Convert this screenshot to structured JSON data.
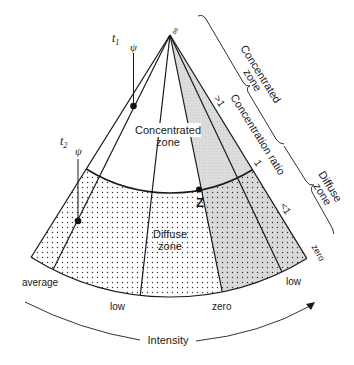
{
  "diagram": {
    "apex_label": "∞",
    "inner_zone": {
      "title_line1": "Concentrated",
      "title_line2": "zone"
    },
    "outer_zone": {
      "title_line1": "Diffuse",
      "title_line2": "zone"
    },
    "point_z_label": "Z",
    "trajectories": [
      {
        "time_label": "t",
        "time_subscript": "1",
        "symbol": "ψ"
      },
      {
        "time_label": "t",
        "time_subscript": "2",
        "symbol": "ψ"
      }
    ],
    "bottom_labels": {
      "average": "average",
      "low_left": "low",
      "zero_mid": "zero",
      "low_right": "low",
      "zero_right": "zero"
    },
    "ratio_labels": {
      "greater": ">1",
      "one": "1",
      "less": "<1"
    },
    "axis_labels": {
      "concentration_ratio": "Concentration ratio",
      "intensity": "Intensity"
    },
    "braces": {
      "concentrated_line1": "Concentrated",
      "concentrated_line2": "zone",
      "diffuse_line1": "Diffuse",
      "diffuse_line2": "zone"
    },
    "colors": {
      "line": "#1a1a1a",
      "shade": "#d9d9d9",
      "dot": "#333333"
    }
  }
}
